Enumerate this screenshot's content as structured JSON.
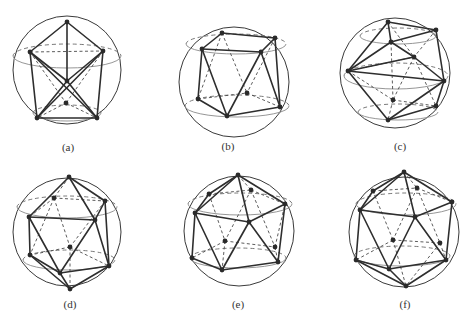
{
  "figure": {
    "panels": [
      {
        "id": "a",
        "caption": "(a)",
        "caption_pos": [
          68,
          151
        ],
        "sphere": {
          "cx": 67,
          "cy": 70,
          "r": 54
        },
        "rings": [
          {
            "cx": 67,
            "cy": 56,
            "rx": 54,
            "ry": 12
          },
          {
            "cx": 67,
            "cy": 113,
            "rx": 34,
            "ry": 8
          }
        ],
        "vertices": [
          [
            67,
            22
          ],
          [
            30,
            52
          ],
          [
            103,
            51
          ],
          [
            67,
            81
          ],
          [
            66,
            103
          ],
          [
            37,
            118
          ],
          [
            97,
            118
          ]
        ],
        "solid_edges": [
          [
            0,
            1
          ],
          [
            0,
            2
          ],
          [
            0,
            3
          ],
          [
            1,
            3
          ],
          [
            2,
            3
          ],
          [
            1,
            5
          ],
          [
            2,
            6
          ],
          [
            5,
            6
          ],
          [
            3,
            5
          ],
          [
            3,
            6
          ],
          [
            1,
            6
          ],
          [
            2,
            5
          ]
        ],
        "hidden_edges": [
          [
            1,
            2
          ],
          [
            4,
            5
          ],
          [
            4,
            6
          ],
          [
            1,
            4
          ],
          [
            2,
            4
          ]
        ]
      },
      {
        "id": "b",
        "caption": "(b)",
        "caption_pos": [
          228,
          150
        ],
        "sphere": {
          "cx": 234,
          "cy": 82,
          "r": 55
        },
        "rings": [
          {
            "cx": 236,
            "cy": 44,
            "rx": 50,
            "ry": 10
          },
          {
            "cx": 237,
            "cy": 106,
            "rx": 52,
            "ry": 11
          }
        ],
        "vertices": [
          [
            222,
            33
          ],
          [
            275,
            38
          ],
          [
            202,
            49
          ],
          [
            261,
            52
          ],
          [
            198,
            99
          ],
          [
            247,
            93
          ],
          [
            227,
            116
          ],
          [
            280,
            107
          ]
        ],
        "solid_edges": [
          [
            0,
            1
          ],
          [
            0,
            2
          ],
          [
            2,
            3
          ],
          [
            1,
            3
          ],
          [
            2,
            4
          ],
          [
            1,
            7
          ],
          [
            3,
            7
          ],
          [
            4,
            6
          ],
          [
            6,
            7
          ],
          [
            2,
            6
          ],
          [
            3,
            6
          ]
        ],
        "hidden_edges": [
          [
            0,
            4
          ],
          [
            0,
            5
          ],
          [
            1,
            5
          ],
          [
            4,
            5
          ],
          [
            5,
            7
          ]
        ]
      },
      {
        "id": "c",
        "caption": "(c)",
        "caption_pos": [
          400,
          150
        ],
        "sphere": {
          "cx": 395,
          "cy": 73,
          "r": 55
        },
        "rings": [
          {
            "cx": 398,
            "cy": 36,
            "rx": 38,
            "ry": 8
          },
          {
            "cx": 396,
            "cy": 76,
            "rx": 52,
            "ry": 13
          },
          {
            "cx": 398,
            "cy": 112,
            "rx": 40,
            "ry": 8
          }
        ],
        "vertices": [
          [
            388,
            22
          ],
          [
            436,
            30
          ],
          [
            391,
            42
          ],
          [
            414,
            57
          ],
          [
            348,
            71
          ],
          [
            444,
            81
          ],
          [
            393,
            100
          ],
          [
            436,
            106
          ],
          [
            388,
            120
          ]
        ],
        "solid_edges": [
          [
            0,
            1
          ],
          [
            0,
            2
          ],
          [
            1,
            2
          ],
          [
            2,
            4
          ],
          [
            2,
            3
          ],
          [
            3,
            4
          ],
          [
            1,
            5
          ],
          [
            3,
            5
          ],
          [
            4,
            5
          ],
          [
            4,
            8
          ],
          [
            5,
            8
          ],
          [
            5,
            7
          ],
          [
            7,
            8
          ],
          [
            0,
            4
          ]
        ],
        "hidden_edges": [
          [
            0,
            3
          ],
          [
            1,
            3
          ],
          [
            4,
            3
          ],
          [
            4,
            6
          ],
          [
            6,
            8
          ],
          [
            6,
            7
          ],
          [
            3,
            6
          ],
          [
            3,
            7
          ],
          [
            2,
            6
          ]
        ]
      },
      {
        "id": "d",
        "caption": "(d)",
        "caption_pos": [
          70,
          308
        ],
        "sphere": {
          "cx": 67,
          "cy": 232,
          "r": 54
        },
        "rings": [
          {
            "cx": 67,
            "cy": 207,
            "rx": 50,
            "ry": 11
          },
          {
            "cx": 69,
            "cy": 260,
            "rx": 46,
            "ry": 10
          }
        ],
        "vertices": [
          [
            69,
            177
          ],
          [
            54,
            198
          ],
          [
            105,
            201
          ],
          [
            29,
            217
          ],
          [
            95,
            220
          ],
          [
            70,
            247
          ],
          [
            30,
            255
          ],
          [
            109,
            266
          ],
          [
            60,
            273
          ],
          [
            70,
            289
          ]
        ],
        "solid_edges": [
          [
            0,
            3
          ],
          [
            0,
            4
          ],
          [
            0,
            2
          ],
          [
            3,
            4
          ],
          [
            2,
            4
          ],
          [
            3,
            6
          ],
          [
            3,
            8
          ],
          [
            4,
            8
          ],
          [
            4,
            7
          ],
          [
            2,
            7
          ],
          [
            6,
            8
          ],
          [
            8,
            7
          ],
          [
            6,
            9
          ],
          [
            8,
            9
          ],
          [
            7,
            9
          ]
        ],
        "hidden_edges": [
          [
            0,
            1
          ],
          [
            1,
            2
          ],
          [
            1,
            3
          ],
          [
            1,
            5
          ],
          [
            2,
            5
          ],
          [
            5,
            6
          ],
          [
            5,
            7
          ],
          [
            5,
            9
          ],
          [
            1,
            6
          ]
        ]
      },
      {
        "id": "e",
        "caption": "(e)",
        "caption_pos": [
          238,
          308
        ],
        "sphere": {
          "cx": 239,
          "cy": 231,
          "r": 55
        },
        "rings": [
          {
            "cx": 240,
            "cy": 204,
            "rx": 52,
            "ry": 11
          },
          {
            "cx": 238,
            "cy": 258,
            "rx": 48,
            "ry": 10
          }
        ],
        "vertices": [
          [
            238,
            175
          ],
          [
            209,
            194
          ],
          [
            251,
            190
          ],
          [
            195,
            213
          ],
          [
            285,
            204
          ],
          [
            249,
            222
          ],
          [
            225,
            241
          ],
          [
            275,
            247
          ],
          [
            192,
            258
          ],
          [
            278,
            262
          ],
          [
            222,
            270
          ]
        ],
        "solid_edges": [
          [
            0,
            1
          ],
          [
            0,
            3
          ],
          [
            0,
            5
          ],
          [
            0,
            4
          ],
          [
            1,
            3
          ],
          [
            3,
            5
          ],
          [
            4,
            5
          ],
          [
            3,
            8
          ],
          [
            3,
            10
          ],
          [
            5,
            10
          ],
          [
            5,
            9
          ],
          [
            4,
            9
          ],
          [
            8,
            10
          ],
          [
            10,
            9
          ]
        ],
        "hidden_edges": [
          [
            0,
            2
          ],
          [
            1,
            2
          ],
          [
            2,
            4
          ],
          [
            1,
            6
          ],
          [
            2,
            6
          ],
          [
            2,
            7
          ],
          [
            6,
            7
          ],
          [
            6,
            8
          ],
          [
            7,
            9
          ],
          [
            6,
            10
          ],
          [
            7,
            4
          ]
        ]
      },
      {
        "id": "f",
        "caption": "(f)",
        "caption_pos": [
          405,
          308
        ],
        "sphere": {
          "cx": 404,
          "cy": 232,
          "r": 55
        },
        "rings": [
          {
            "cx": 406,
            "cy": 204,
            "rx": 50,
            "ry": 11
          },
          {
            "cx": 402,
            "cy": 256,
            "rx": 48,
            "ry": 10
          }
        ],
        "vertices": [
          [
            404,
            172
          ],
          [
            373,
            191
          ],
          [
            417,
            188
          ],
          [
            360,
            210
          ],
          [
            452,
            202
          ],
          [
            415,
            217
          ],
          [
            393,
            240
          ],
          [
            440,
            243
          ],
          [
            356,
            260
          ],
          [
            446,
            260
          ],
          [
            389,
            269
          ],
          [
            406,
            286
          ]
        ],
        "solid_edges": [
          [
            0,
            1
          ],
          [
            0,
            3
          ],
          [
            0,
            5
          ],
          [
            0,
            4
          ],
          [
            1,
            3
          ],
          [
            3,
            5
          ],
          [
            4,
            5
          ],
          [
            3,
            8
          ],
          [
            3,
            10
          ],
          [
            5,
            10
          ],
          [
            5,
            9
          ],
          [
            4,
            9
          ],
          [
            8,
            10
          ],
          [
            10,
            9
          ],
          [
            8,
            11
          ],
          [
            10,
            11
          ],
          [
            9,
            11
          ]
        ],
        "hidden_edges": [
          [
            0,
            2
          ],
          [
            1,
            2
          ],
          [
            2,
            4
          ],
          [
            1,
            6
          ],
          [
            2,
            6
          ],
          [
            2,
            7
          ],
          [
            6,
            7
          ],
          [
            6,
            8
          ],
          [
            7,
            9
          ],
          [
            6,
            11
          ],
          [
            7,
            11
          ]
        ]
      }
    ]
  }
}
